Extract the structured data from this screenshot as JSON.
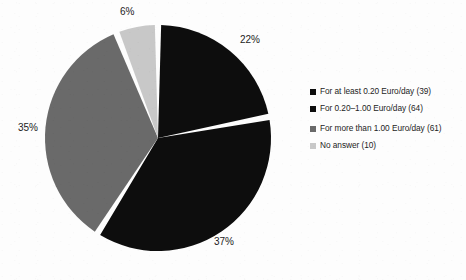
{
  "chart_data": {
    "type": "pie",
    "title": "",
    "categories": [
      "For at least 0.20 Euro/day (39)",
      "For 0.20–1.00 Euro/day (64)",
      "For more than 1.00 Euro/day (61)",
      "No answer (10)"
    ],
    "values": [
      22,
      37,
      35,
      6
    ],
    "counts": [
      39,
      64,
      61,
      10
    ],
    "value_labels": [
      "22%",
      "37%",
      "35%",
      "6%"
    ],
    "colors": [
      "#0d0d0d",
      "#0d0d0d",
      "#6a6a6a",
      "#c8c8c8"
    ],
    "legend_position": "right",
    "start_angle_deg": 0,
    "direction": "clockwise",
    "slice_gap": true,
    "grid": false,
    "xlabel": "",
    "ylabel": ""
  },
  "slices": [
    {
      "label": "22%",
      "value": 22,
      "color": "#0d0d0d"
    },
    {
      "label": "37%",
      "value": 37,
      "color": "#0d0d0d"
    },
    {
      "label": "35%",
      "value": 35,
      "color": "#6a6a6a"
    },
    {
      "label": "6%",
      "value": 6,
      "color": "#c8c8c8"
    }
  ],
  "legend": {
    "items": [
      {
        "text": "For at least 0.20 Euro/day (39)",
        "color": "#0d0d0d"
      },
      {
        "text": "For 0.20–1.00 Euro/day (64)",
        "color": "#0d0d0d"
      },
      {
        "text": "For more than 1.00 Euro/day (61)",
        "color": "#6a6a6a"
      },
      {
        "text": "No answer (10)",
        "color": "#c8c8c8"
      }
    ]
  }
}
